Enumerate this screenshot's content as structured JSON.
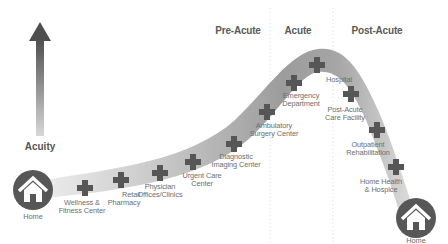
{
  "diagram": {
    "axis": {
      "label": "Acuity",
      "arrow_direction": "up"
    },
    "phases": [
      {
        "label": "Pre-Acute"
      },
      {
        "label": "Acute"
      },
      {
        "label": "Post-Acute"
      }
    ],
    "endpoints": {
      "start": {
        "label": "Home",
        "icon": "home-icon"
      },
      "end": {
        "label": "Home",
        "icon": "home-icon"
      }
    },
    "care_settings": [
      {
        "label": "Wellness &\nFitness Center",
        "icon": "medical-cross-icon"
      },
      {
        "label": "Retail\nPharmacy",
        "icon": "medical-cross-icon"
      },
      {
        "label": "Physician\nOffices/Clinics",
        "icon": "medical-cross-icon"
      },
      {
        "label": "Urgent Care\nCenter",
        "icon": "medical-cross-icon"
      },
      {
        "label": "Diagnostic\nImaging Center",
        "icon": "medical-cross-icon"
      },
      {
        "label": "Ambulatory\nSurgery Center",
        "icon": "medical-cross-icon"
      },
      {
        "label": "Emergency\nDepartment",
        "icon": "medical-cross-icon"
      },
      {
        "label": "Hospital",
        "icon": "medical-cross-icon"
      },
      {
        "label": "Post-Acute\nCare Facility",
        "icon": "medical-cross-icon"
      },
      {
        "label": "Outpatient\nRehabilitation",
        "icon": "medical-cross-icon"
      },
      {
        "label": "Home Health\n& Hospice",
        "icon": "medical-cross-icon"
      }
    ],
    "colors": {
      "icon_dark": "#555555",
      "band_light": "#e6e6e6",
      "band_dark": "#9a9a9a",
      "text": "#6e6e6e",
      "header_text": "#5a5a5a",
      "divider": "#dddddd"
    }
  }
}
